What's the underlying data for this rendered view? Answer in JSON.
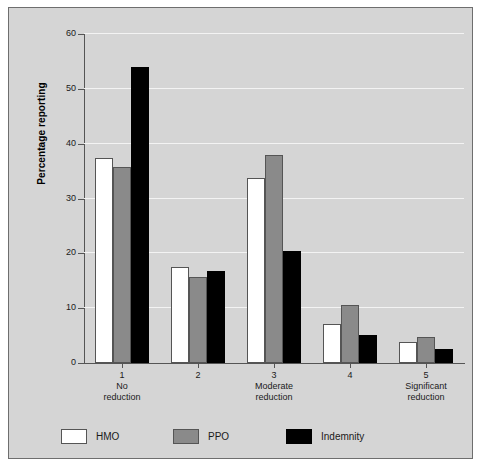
{
  "chart_data": {
    "type": "bar",
    "title": "",
    "subtitle": "",
    "xlabel": "",
    "ylabel": "Percentage reporting",
    "ylim": [
      0,
      60
    ],
    "yticks": [
      0,
      10,
      20,
      30,
      40,
      50,
      60
    ],
    "ytick_labels": [
      "0",
      "10",
      "20",
      "30",
      "40",
      "50",
      "60"
    ],
    "grid": true,
    "grid_axis": "y",
    "legend_position": "bottom-left",
    "categories": [
      "1",
      "2",
      "3",
      "4",
      "5"
    ],
    "category_sublabels": [
      "No\nreduction",
      "",
      "Moderate\nreduction",
      "",
      "Significant\nreduction"
    ],
    "category_labels": [
      {
        "number": "1",
        "line1": "No",
        "line2": "reduction"
      },
      {
        "number": "2",
        "line1": "",
        "line2": ""
      },
      {
        "number": "3",
        "line1": "Moderate",
        "line2": "reduction"
      },
      {
        "number": "4",
        "line1": "",
        "line2": ""
      },
      {
        "number": "5",
        "line1": "Significant",
        "line2": "reduction"
      }
    ],
    "series": [
      {
        "name": "HMO",
        "color": "#ffffff",
        "values": [
          37.4,
          17.5,
          33.8,
          7.2,
          3.9
        ]
      },
      {
        "name": "PPO",
        "color": "#8a8a8a",
        "values": [
          35.8,
          15.6,
          38.0,
          10.5,
          4.7
        ]
      },
      {
        "name": "Indemnity",
        "color": "#000000",
        "values": [
          54.0,
          16.8,
          20.5,
          5.2,
          2.5
        ]
      }
    ]
  },
  "legend": {
    "items": [
      {
        "label": "HMO",
        "key": "hmo"
      },
      {
        "label": "PPO",
        "key": "ppo"
      },
      {
        "label": "Indemnity",
        "key": "ind"
      }
    ]
  },
  "colors": {
    "panel_background": "#d5d5d5",
    "panel_border": "#6e6e6e",
    "gridline": "#f3f3f3",
    "axis": "#555555",
    "hmo": "#ffffff",
    "ppo": "#8a8a8a",
    "indemnity": "#000000"
  }
}
